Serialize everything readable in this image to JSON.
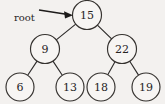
{
  "figure": {
    "kind": "binary-search-tree-diagram",
    "background_color": "#f3f1ef",
    "stroke_color": "#35322f",
    "text_color": "#26241f",
    "width": 165,
    "height": 104
  },
  "annotation": {
    "root_label": "root",
    "arrow_name": "root-pointer-arrow"
  },
  "tree": {
    "nodes": [
      {
        "id": "n15",
        "label": "15",
        "cx": 87,
        "cy": 15,
        "r": 14.5,
        "level": 0
      },
      {
        "id": "n9",
        "label": "9",
        "cx": 45,
        "cy": 49,
        "r": 14.5,
        "level": 1
      },
      {
        "id": "n22",
        "label": "22",
        "cx": 122,
        "cy": 49,
        "r": 14.5,
        "level": 1
      },
      {
        "id": "n6",
        "label": "6",
        "cx": 20,
        "cy": 87,
        "r": 14.0,
        "level": 2
      },
      {
        "id": "n13",
        "label": "13",
        "cx": 70,
        "cy": 87,
        "r": 14.0,
        "level": 2
      },
      {
        "id": "n18",
        "label": "18",
        "cx": 101,
        "cy": 87,
        "r": 14.0,
        "level": 2
      },
      {
        "id": "n19",
        "label": "19",
        "cx": 146,
        "cy": 87,
        "r": 14.0,
        "level": 2
      }
    ],
    "edges": [
      {
        "from": "n15",
        "to": "n9",
        "x1": 78,
        "y1": 26,
        "x2": 54,
        "y2": 38
      },
      {
        "from": "n15",
        "to": "n22",
        "x1": 96,
        "y1": 26,
        "x2": 113,
        "y2": 38
      },
      {
        "from": "n9",
        "to": "n6",
        "x1": 38,
        "y1": 61,
        "x2": 27,
        "y2": 75
      },
      {
        "from": "n9",
        "to": "n13",
        "x1": 52,
        "y1": 61,
        "x2": 63,
        "y2": 75
      },
      {
        "from": "n22",
        "to": "n18",
        "x1": 115,
        "y1": 61,
        "x2": 108,
        "y2": 75
      },
      {
        "from": "n22",
        "to": "n19",
        "x1": 129,
        "y1": 61,
        "x2": 139,
        "y2": 75
      }
    ]
  }
}
